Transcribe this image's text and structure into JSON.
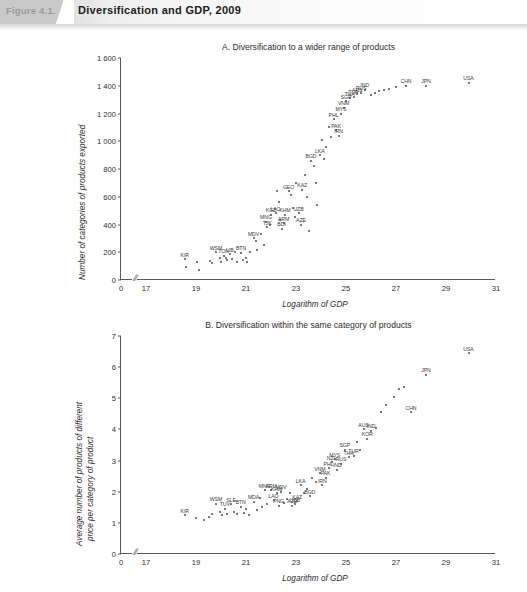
{
  "header": {
    "figure_number": "Figure 4.1.",
    "title": "Diversification and GDP, 2009"
  },
  "chart_data": [
    {
      "type": "scatter",
      "panel": "A",
      "title": "A. Diversification to a wider range of products",
      "xlabel": "Logarithm of GDP",
      "ylabel": "Number of categories of products exported",
      "xlim": [
        16.0,
        31.0
      ],
      "ylim": [
        0,
        1600
      ],
      "xticks": [
        "0",
        "17",
        "19",
        "21",
        "23",
        "25",
        "27",
        "29",
        "31"
      ],
      "xtick_values": [
        16.0,
        17,
        19,
        21,
        23,
        25,
        27,
        29,
        31
      ],
      "yticks": [
        "0",
        "200",
        "400",
        "600",
        "800",
        "1 000",
        "1 200",
        "1 400",
        "1 600"
      ],
      "ytick_values": [
        0,
        200,
        400,
        600,
        800,
        1000,
        1200,
        1400,
        1600
      ],
      "axis_break": "//",
      "grid": false,
      "legend": "none",
      "points": [
        {
          "x": 18.55,
          "y": 150,
          "label": "KIR"
        },
        {
          "x": 18.6,
          "y": 95
        },
        {
          "x": 19.05,
          "y": 130
        },
        {
          "x": 19.1,
          "y": 70
        },
        {
          "x": 19.55,
          "y": 135
        },
        {
          "x": 19.62,
          "y": 120
        },
        {
          "x": 19.8,
          "y": 200,
          "label": "WSM"
        },
        {
          "x": 19.95,
          "y": 160
        },
        {
          "x": 20.0,
          "y": 130
        },
        {
          "x": 20.1,
          "y": 175,
          "label": "TON"
        },
        {
          "x": 20.18,
          "y": 155
        },
        {
          "x": 20.25,
          "y": 145
        },
        {
          "x": 20.35,
          "y": 185,
          "label": "LIB"
        },
        {
          "x": 20.45,
          "y": 150
        },
        {
          "x": 20.55,
          "y": 205
        },
        {
          "x": 20.62,
          "y": 130
        },
        {
          "x": 20.8,
          "y": 195,
          "label": "BTN"
        },
        {
          "x": 20.88,
          "y": 145
        },
        {
          "x": 21.0,
          "y": 160
        },
        {
          "x": 21.05,
          "y": 130
        },
        {
          "x": 21.15,
          "y": 205
        },
        {
          "x": 21.3,
          "y": 300,
          "label": "MDV"
        },
        {
          "x": 21.4,
          "y": 280
        },
        {
          "x": 21.45,
          "y": 215
        },
        {
          "x": 21.6,
          "y": 330
        },
        {
          "x": 21.7,
          "y": 255
        },
        {
          "x": 21.8,
          "y": 420,
          "label": "MNG"
        },
        {
          "x": 21.85,
          "y": 380,
          "label": "TJK"
        },
        {
          "x": 21.95,
          "y": 400
        },
        {
          "x": 22.0,
          "y": 470,
          "label": "KGZ"
        },
        {
          "x": 22.18,
          "y": 480,
          "label": "LAO"
        },
        {
          "x": 22.25,
          "y": 640
        },
        {
          "x": 22.3,
          "y": 560
        },
        {
          "x": 22.35,
          "y": 430
        },
        {
          "x": 22.42,
          "y": 370,
          "label": "BDI"
        },
        {
          "x": 22.5,
          "y": 410,
          "label": "ARM"
        },
        {
          "x": 22.55,
          "y": 470,
          "label": "KHM"
        },
        {
          "x": 22.7,
          "y": 640,
          "label": "GEO"
        },
        {
          "x": 22.8,
          "y": 610
        },
        {
          "x": 22.88,
          "y": 520
        },
        {
          "x": 22.95,
          "y": 455
        },
        {
          "x": 23.0,
          "y": 700
        },
        {
          "x": 23.1,
          "y": 480,
          "label": "UZB"
        },
        {
          "x": 23.2,
          "y": 400,
          "label": "AZE"
        },
        {
          "x": 23.25,
          "y": 650,
          "label": "KAZ"
        },
        {
          "x": 23.35,
          "y": 760
        },
        {
          "x": 23.45,
          "y": 600
        },
        {
          "x": 23.5,
          "y": 350
        },
        {
          "x": 23.6,
          "y": 860,
          "label": "BGD"
        },
        {
          "x": 23.7,
          "y": 820
        },
        {
          "x": 23.78,
          "y": 700
        },
        {
          "x": 23.85,
          "y": 540
        },
        {
          "x": 23.95,
          "y": 900,
          "label": "LKA"
        },
        {
          "x": 24.05,
          "y": 1010
        },
        {
          "x": 24.1,
          "y": 870
        },
        {
          "x": 24.2,
          "y": 960
        },
        {
          "x": 24.3,
          "y": 1100
        },
        {
          "x": 24.4,
          "y": 1030
        },
        {
          "x": 24.5,
          "y": 1160,
          "label": "PHL"
        },
        {
          "x": 24.6,
          "y": 1080,
          "label": "PAK"
        },
        {
          "x": 24.7,
          "y": 1040,
          "label": "IRN"
        },
        {
          "x": 24.8,
          "y": 1200,
          "label": "MYS"
        },
        {
          "x": 24.9,
          "y": 1240,
          "label": "VNM"
        },
        {
          "x": 25.0,
          "y": 1290,
          "label": "SGP"
        },
        {
          "x": 25.15,
          "y": 1310,
          "label": "THA"
        },
        {
          "x": 25.3,
          "y": 1320,
          "label": "TUR"
        },
        {
          "x": 25.45,
          "y": 1340,
          "label": "AUS"
        },
        {
          "x": 25.6,
          "y": 1350,
          "label": "RUS"
        },
        {
          "x": 25.75,
          "y": 1370,
          "label": "IND"
        },
        {
          "x": 26.0,
          "y": 1330
        },
        {
          "x": 26.15,
          "y": 1350
        },
        {
          "x": 26.3,
          "y": 1360
        },
        {
          "x": 26.5,
          "y": 1370
        },
        {
          "x": 26.7,
          "y": 1380
        },
        {
          "x": 27.0,
          "y": 1390
        },
        {
          "x": 27.4,
          "y": 1400,
          "label": "CHN"
        },
        {
          "x": 28.2,
          "y": 1400,
          "label": "JPN"
        },
        {
          "x": 29.9,
          "y": 1420,
          "label": "USA"
        }
      ]
    },
    {
      "type": "scatter",
      "panel": "B",
      "title": "B. Diversification within the same category of products",
      "xlabel": "Logarithm of GDP",
      "ylabel_line1": "Average number of products of different",
      "ylabel_line2": "price per category of product",
      "xlim": [
        16.0,
        31.0
      ],
      "ylim": [
        0,
        7
      ],
      "xticks": [
        "0",
        "17",
        "19",
        "21",
        "23",
        "25",
        "27",
        "29",
        "31"
      ],
      "xtick_values": [
        16.0,
        17,
        19,
        21,
        23,
        25,
        27,
        29,
        31
      ],
      "yticks": [
        "0",
        "1",
        "2",
        "3",
        "4",
        "5",
        "6",
        "7"
      ],
      "ytick_values": [
        0,
        1,
        2,
        3,
        4,
        5,
        6,
        7
      ],
      "axis_break": "//",
      "grid": false,
      "legend": "none",
      "points": [
        {
          "x": 18.55,
          "y": 1.25,
          "label": "KIR"
        },
        {
          "x": 19.0,
          "y": 1.15
        },
        {
          "x": 19.3,
          "y": 1.1
        },
        {
          "x": 19.5,
          "y": 1.2
        },
        {
          "x": 19.62,
          "y": 1.3
        },
        {
          "x": 19.8,
          "y": 1.62,
          "label": "WSM"
        },
        {
          "x": 19.95,
          "y": 1.35
        },
        {
          "x": 20.05,
          "y": 1.25
        },
        {
          "x": 20.15,
          "y": 1.45,
          "label": "TUV"
        },
        {
          "x": 20.25,
          "y": 1.3
        },
        {
          "x": 20.4,
          "y": 1.6,
          "label": "SLE"
        },
        {
          "x": 20.5,
          "y": 1.35
        },
        {
          "x": 20.62,
          "y": 1.28
        },
        {
          "x": 20.78,
          "y": 1.52,
          "label": "BTN"
        },
        {
          "x": 20.9,
          "y": 1.33
        },
        {
          "x": 21.0,
          "y": 1.45
        },
        {
          "x": 21.12,
          "y": 1.25
        },
        {
          "x": 21.3,
          "y": 1.68,
          "label": "MDA"
        },
        {
          "x": 21.45,
          "y": 1.4
        },
        {
          "x": 21.55,
          "y": 1.8
        },
        {
          "x": 21.62,
          "y": 1.5
        },
        {
          "x": 21.75,
          "y": 2.05,
          "label": "MNG"
        },
        {
          "x": 21.85,
          "y": 1.62
        },
        {
          "x": 22.0,
          "y": 2.05,
          "label": "ARM"
        },
        {
          "x": 22.1,
          "y": 1.72,
          "label": "LAO"
        },
        {
          "x": 22.22,
          "y": 1.95,
          "label": "KHM"
        },
        {
          "x": 22.3,
          "y": 1.55,
          "label": "PNG"
        },
        {
          "x": 22.4,
          "y": 2.0,
          "label": "MDV"
        },
        {
          "x": 22.5,
          "y": 1.65
        },
        {
          "x": 22.62,
          "y": 1.78
        },
        {
          "x": 22.75,
          "y": 1.95
        },
        {
          "x": 22.85,
          "y": 1.55,
          "label": "AZE"
        },
        {
          "x": 22.95,
          "y": 1.6,
          "label": "UZB"
        },
        {
          "x": 23.05,
          "y": 1.7,
          "label": "KAZ"
        },
        {
          "x": 23.18,
          "y": 2.2,
          "label": "LKA"
        },
        {
          "x": 23.3,
          "y": 1.95
        },
        {
          "x": 23.45,
          "y": 2.1
        },
        {
          "x": 23.55,
          "y": 1.85,
          "label": "BGD"
        },
        {
          "x": 23.65,
          "y": 2.45
        },
        {
          "x": 23.8,
          "y": 2.3
        },
        {
          "x": 23.95,
          "y": 2.6,
          "label": "VNM"
        },
        {
          "x": 24.05,
          "y": 2.2,
          "label": "IRN"
        },
        {
          "x": 24.18,
          "y": 2.45,
          "label": "PAK"
        },
        {
          "x": 24.3,
          "y": 2.75,
          "label": "PHL"
        },
        {
          "x": 24.42,
          "y": 2.95,
          "label": "NZL"
        },
        {
          "x": 24.55,
          "y": 3.05,
          "label": "MYS"
        },
        {
          "x": 24.65,
          "y": 2.7,
          "label": "IND"
        },
        {
          "x": 24.8,
          "y": 2.9,
          "label": "RUS"
        },
        {
          "x": 24.95,
          "y": 3.35,
          "label": "SGP"
        },
        {
          "x": 25.1,
          "y": 3.1,
          "label": "THA"
        },
        {
          "x": 25.3,
          "y": 3.15,
          "label": "TUR"
        },
        {
          "x": 25.45,
          "y": 3.6
        },
        {
          "x": 25.55,
          "y": 3.35
        },
        {
          "x": 25.7,
          "y": 4.0,
          "label": "AUS"
        },
        {
          "x": 25.85,
          "y": 3.7,
          "label": "KOR"
        },
        {
          "x": 26.0,
          "y": 3.95,
          "label": "IND"
        },
        {
          "x": 26.2,
          "y": 4.05
        },
        {
          "x": 26.4,
          "y": 4.55
        },
        {
          "x": 26.6,
          "y": 4.8
        },
        {
          "x": 26.9,
          "y": 5.05
        },
        {
          "x": 27.1,
          "y": 5.3
        },
        {
          "x": 27.3,
          "y": 5.35
        },
        {
          "x": 27.6,
          "y": 4.55,
          "label": "CHN"
        },
        {
          "x": 28.2,
          "y": 5.75,
          "label": "JPN"
        },
        {
          "x": 29.9,
          "y": 6.45,
          "label": "USA"
        }
      ]
    }
  ]
}
